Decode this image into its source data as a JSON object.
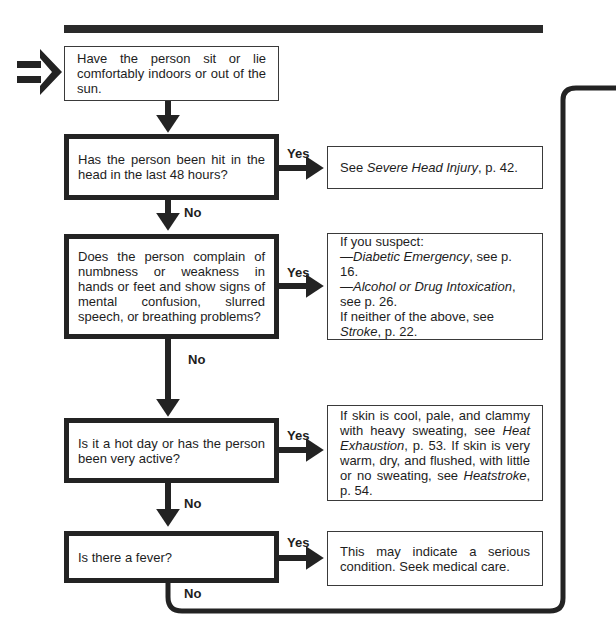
{
  "flowchart": {
    "start": {
      "text": "Have the person sit or lie comfortably indoors or out of the sun."
    },
    "steps": [
      {
        "question": "Has the person been hit in the head in the last 48 hours?",
        "yes_label": "Yes",
        "no_label": "No",
        "yes_result": {
          "parts": [
            {
              "text": "See ",
              "italic": false
            },
            {
              "text": "Severe Head Injury",
              "italic": true
            },
            {
              "text": ", p. 42.",
              "italic": false
            }
          ]
        }
      },
      {
        "question": "Does the person complain of numbness or weakness in hands or feet and show signs of mental confusion, slurred speech, or breathing problems?",
        "yes_label": "Yes",
        "no_label": "No",
        "yes_result": {
          "line1": "If you suspect:",
          "line2_prefix": "—",
          "line2_italic": "Diabetic Emergency",
          "line2_suffix": ", see p. 16.",
          "line3_prefix": "—",
          "line3_italic": "Alcohol or Drug Intoxication",
          "line3_suffix": ", see p. 26.",
          "line4_prefix": "If neither of the above, see ",
          "line4_italic": "Stroke",
          "line4_suffix": ", p. 22."
        }
      },
      {
        "question": "Is it a hot day or has the person been very active?",
        "yes_label": "Yes",
        "no_label": "No",
        "yes_result": {
          "part1": "If skin is cool, pale, and clammy with heavy sweating, see ",
          "italic1": "Heat Exhaustion",
          "part2": ", p. 53. If skin is very warm, dry, and flushed, with little or no sweating, see ",
          "italic2": "Heatstroke",
          "part3": ", p. 54."
        }
      },
      {
        "question": "Is there a fever?",
        "yes_label": "Yes",
        "no_label": "No",
        "yes_result": {
          "text": "This may indicate a serious condition. Seek medical care."
        }
      }
    ],
    "icons": {
      "entry": "double-arrow-right-icon"
    }
  }
}
